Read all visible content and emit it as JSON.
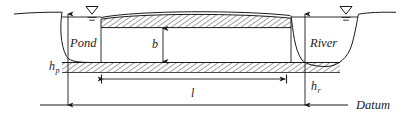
{
  "figure": {
    "type": "cross-section-diagram",
    "background_color": "#ffffff",
    "line_color": "#1a1a1a",
    "hatch_color": "#2b2b2b"
  },
  "labels": {
    "pond": "Pond",
    "river": "River",
    "datum": "Datum"
  },
  "dimensions": {
    "aquifer_thickness": "b",
    "flow_length": "l",
    "pond_head_base": "h",
    "pond_head_sub": "p",
    "river_head_base": "h",
    "river_head_sub": "r"
  },
  "symbols": {
    "pond_water_table": "water-table-triangle",
    "river_water_table": "water-table-triangle"
  },
  "geometry": {
    "datum_y": 105,
    "pond_water_surface_y": 17,
    "river_water_surface_y": 17,
    "confining_layer_top_y": 19,
    "confining_layer_bottom_y": 27,
    "aquifer_bottom_y": 62,
    "aquitard_bottom_y": 72,
    "flow_length_arrow_y": 79,
    "flow_length_x_start": 101,
    "flow_length_x_end": 287,
    "thickness_arrow_x": 163,
    "pond_head_arrow_x": 68,
    "river_head_arrow_x": 305
  }
}
